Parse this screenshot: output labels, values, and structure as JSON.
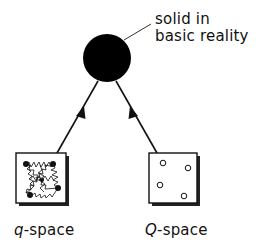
{
  "diagram": {
    "root": {
      "label_line1": "solid in",
      "label_line2": "basic reality",
      "color": "#000000"
    },
    "children": [
      {
        "id": "q-space",
        "label_italic": "q",
        "label_rest": "-space",
        "content": "connected particles with springs"
      },
      {
        "id": "Q-space",
        "label_italic": "Q",
        "label_rest": "-space",
        "content": "isolated open points"
      }
    ]
  }
}
